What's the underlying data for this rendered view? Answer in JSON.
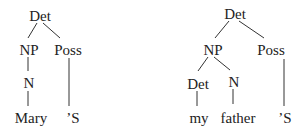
{
  "trees": [
    {
      "name": "mary-possessive",
      "nodes": {
        "root": "Det",
        "np": "NP",
        "poss": "Poss",
        "n": "N",
        "word1": "Mary",
        "suffix": "’S"
      }
    },
    {
      "name": "my-father-possessive",
      "nodes": {
        "root": "Det",
        "np": "NP",
        "poss": "Poss",
        "det": "Det",
        "n": "N",
        "word1": "my",
        "word2": "father",
        "suffix": "’S"
      }
    }
  ],
  "colors": {
    "text": "#222222",
    "lines": "#333333",
    "background": "#ffffff"
  }
}
